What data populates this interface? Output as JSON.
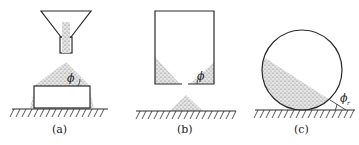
{
  "figure": {
    "panels": [
      {
        "id": "a",
        "label": "(a)",
        "angle_symbol": "ϕ",
        "description": "Granular material poured from funnel forming a heap on a raised block"
      },
      {
        "id": "b",
        "label": "(b)",
        "angle_symbol": "ϕ",
        "description": "Material draining from bin through bottom orifice forming a heap below"
      },
      {
        "id": "c",
        "label": "(c)",
        "angle_symbol": "ϕ",
        "angle_subscript": "r",
        "description": "Rotating drum with material at dynamic angle of repose"
      }
    ],
    "colors": {
      "line": "#2a2a2a",
      "fill": "#9a9a9a",
      "background": "#ffffff"
    }
  }
}
